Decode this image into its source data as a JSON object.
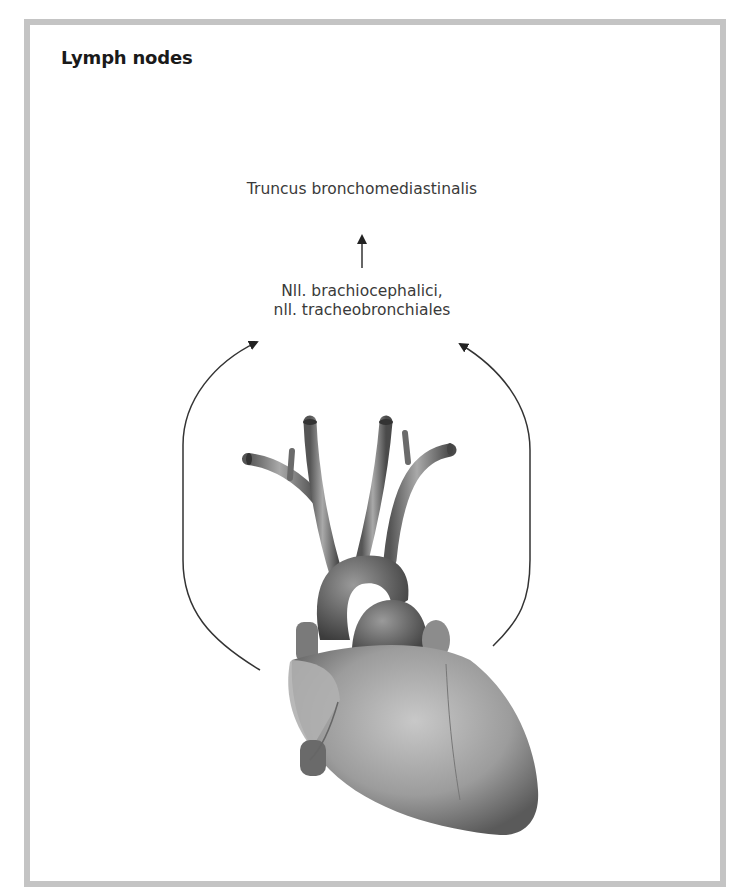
{
  "figure": {
    "title": "Lymph nodes",
    "colors": {
      "frame": "#c4c4c4",
      "text": "#3a3a3a",
      "title": "#1a1a1a",
      "arrow": "#333333"
    }
  },
  "nodes": {
    "top": {
      "label": "Truncus bronchomediastinalis"
    },
    "middle": {
      "line1": "Nll. brachiocephalici,",
      "line2": "nll. tracheobronchiales"
    }
  },
  "arrows": [
    {
      "name": "middle-to-top",
      "from": "Nll. brachiocephalici, nll. tracheobronchiales",
      "to": "Truncus bronchomediastinalis"
    },
    {
      "name": "heart-left-to-middle",
      "from": "heart",
      "to": "Nll. brachiocephalici, nll. tracheobronchiales"
    },
    {
      "name": "heart-right-to-middle",
      "from": "heart",
      "to": "Nll. brachiocephalici, nll. tracheobronchiales"
    }
  ],
  "illustration": {
    "subject": "heart (anterior view) with great vessels",
    "style": "grayscale"
  }
}
